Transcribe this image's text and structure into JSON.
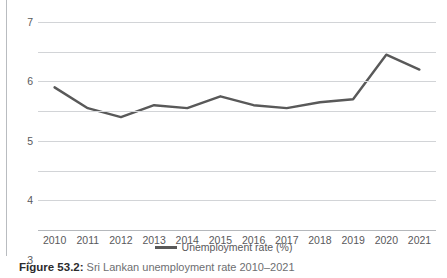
{
  "page": {
    "top_cut_text": "· ·        ·   ·"
  },
  "caption": {
    "prefix": "Figure 53.2:",
    "text": " Sri Lankan unemployment rate 2010–2021"
  },
  "legend": {
    "position": "bottom-center",
    "items": [
      {
        "label": "Unemployment rate (%)",
        "color": "#595959"
      }
    ]
  },
  "axes": {
    "y_ticks": [
      "0",
      "1",
      "2",
      "3",
      "4",
      "5",
      "6",
      "7"
    ],
    "x_ticks": [
      "2010",
      "2011",
      "2012",
      "2013",
      "2014",
      "2015",
      "2016",
      "2017",
      "2018",
      "2019",
      "2020",
      "2021"
    ]
  },
  "colors": {
    "line": "#595959",
    "gridline": "#d2d4d7",
    "axis": "#b5b8bc",
    "tick_text": "#59595b",
    "caption_prefix": "#2b2b2d",
    "caption_text": "#6d6e71",
    "page_rule": "#b9bcc0",
    "background": "#ffffff"
  },
  "chart_data": {
    "type": "line",
    "title": "",
    "subtitle": "",
    "xlabel": "",
    "ylabel": "",
    "categories": [
      "2010",
      "2011",
      "2012",
      "2013",
      "2014",
      "2015",
      "2016",
      "2017",
      "2018",
      "2019",
      "2020",
      "2021"
    ],
    "series": [
      {
        "name": "Unemployment rate (%)",
        "color": "#595959",
        "values": [
          4.8,
          4.1,
          3.8,
          4.2,
          4.1,
          4.5,
          4.2,
          4.1,
          4.3,
          4.4,
          5.9,
          5.4
        ]
      }
    ],
    "ylim": [
      0,
      7
    ],
    "ytick_step": 1,
    "grid": true,
    "markers": false,
    "legend_position": "bottom-center"
  }
}
